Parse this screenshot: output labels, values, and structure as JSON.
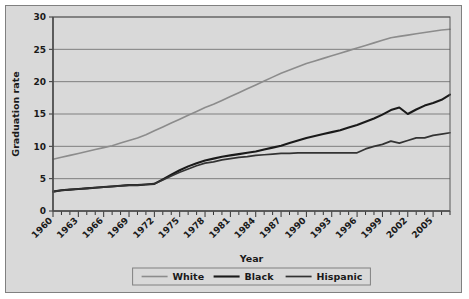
{
  "chart_data": {
    "type": "line",
    "title": "",
    "xlabel": "Year",
    "ylabel": "Graduation rate",
    "xlim": [
      1960,
      2007
    ],
    "ylim": [
      0,
      30
    ],
    "yticks": [
      0,
      5,
      10,
      15,
      20,
      25,
      30
    ],
    "xticks": [
      1960,
      1963,
      1966,
      1969,
      1972,
      1975,
      1978,
      1981,
      1984,
      1987,
      1990,
      1993,
      1996,
      1999,
      2002,
      2005
    ],
    "grid": "horizontal",
    "legend_position": "bottom",
    "x": [
      1960,
      1961,
      1962,
      1963,
      1964,
      1965,
      1966,
      1967,
      1968,
      1969,
      1970,
      1971,
      1972,
      1973,
      1974,
      1975,
      1976,
      1977,
      1978,
      1979,
      1980,
      1981,
      1982,
      1983,
      1984,
      1985,
      1986,
      1987,
      1988,
      1989,
      1990,
      1991,
      1992,
      1993,
      1994,
      1995,
      1996,
      1997,
      1998,
      1999,
      2000,
      2001,
      2002,
      2003,
      2004,
      2005,
      2006,
      2007
    ],
    "series": [
      {
        "name": "White",
        "color": "#8c8c8c",
        "width": 1.6,
        "values": [
          8.0,
          8.3,
          8.6,
          8.9,
          9.2,
          9.5,
          9.8,
          10.1,
          10.5,
          10.9,
          11.3,
          11.8,
          12.4,
          13.0,
          13.6,
          14.2,
          14.8,
          15.4,
          16.0,
          16.5,
          17.1,
          17.7,
          18.3,
          18.9,
          19.5,
          20.1,
          20.7,
          21.3,
          21.8,
          22.3,
          22.8,
          23.2,
          23.6,
          24.0,
          24.4,
          24.8,
          25.2,
          25.6,
          26.0,
          26.4,
          26.8,
          27.0,
          27.2,
          27.4,
          27.6,
          27.8,
          28.0,
          28.1
        ]
      },
      {
        "name": "Black",
        "color": "#1a1a1a",
        "width": 2.1,
        "values": [
          3.0,
          3.2,
          3.3,
          3.4,
          3.5,
          3.6,
          3.7,
          3.8,
          3.9,
          4.0,
          4.0,
          4.1,
          4.2,
          4.9,
          5.6,
          6.3,
          6.9,
          7.4,
          7.8,
          8.1,
          8.4,
          8.6,
          8.8,
          9.0,
          9.2,
          9.5,
          9.8,
          10.1,
          10.5,
          10.9,
          11.3,
          11.6,
          11.9,
          12.2,
          12.5,
          12.9,
          13.3,
          13.8,
          14.3,
          14.9,
          15.6,
          16.0,
          15.0,
          15.7,
          16.3,
          16.7,
          17.2,
          18.0
        ]
      },
      {
        "name": "Hispanic",
        "color": "#333333",
        "width": 1.7,
        "values": [
          3.0,
          3.2,
          3.3,
          3.4,
          3.5,
          3.6,
          3.7,
          3.8,
          3.9,
          4.0,
          4.0,
          4.1,
          4.2,
          4.8,
          5.4,
          6.0,
          6.5,
          7.0,
          7.4,
          7.6,
          7.9,
          8.1,
          8.3,
          8.4,
          8.6,
          8.7,
          8.8,
          8.9,
          8.9,
          9.0,
          9.0,
          9.0,
          9.0,
          9.0,
          9.0,
          9.0,
          9.0,
          9.6,
          10.0,
          10.3,
          10.8,
          10.5,
          10.9,
          11.3,
          11.3,
          11.7,
          11.9,
          12.1
        ]
      }
    ]
  },
  "legend": {
    "items": [
      {
        "label": "White"
      },
      {
        "label": "Black"
      },
      {
        "label": "Hispanic"
      }
    ]
  }
}
